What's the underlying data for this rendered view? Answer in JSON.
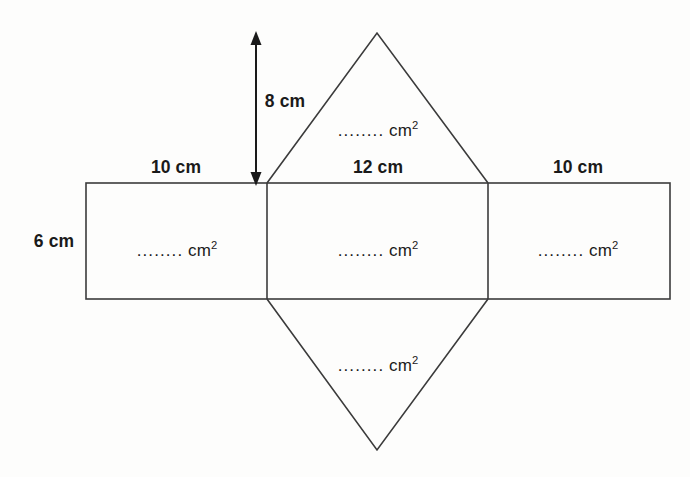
{
  "figure": {
    "kind": "net-of-triangular-prism",
    "stroke_color": "#3b3b3b",
    "background_color": "#fdfdfc",
    "text_color": "#1a1a1a"
  },
  "dimension_labels": {
    "height_8cm": "8 cm",
    "left_rect_10cm": "10 cm",
    "middle_rect_12cm": "12 cm",
    "right_rect_10cm": "10 cm",
    "rect_depth_6cm": "6 cm"
  },
  "area_placeholders": {
    "dots": "........",
    "unit": "cm",
    "exponent": "2",
    "top_triangle": "........ cm2",
    "left_rectangle": "........ cm2",
    "middle_rectangle": "........ cm2",
    "right_rectangle": "........ cm2",
    "bottom_triangle": "........ cm2"
  },
  "geometry": {
    "outer_rect": {
      "x1": 86,
      "y1": 183,
      "x2": 670,
      "y2": 299
    },
    "divider_left_x": 267,
    "divider_right_x": 488,
    "top_triangle_apex": {
      "x": 377,
      "y": 33
    },
    "bottom_triangle_apex": {
      "x": 377,
      "y": 450
    },
    "arrow": {
      "x": 256,
      "y_top": 34,
      "y_bottom": 183
    }
  }
}
